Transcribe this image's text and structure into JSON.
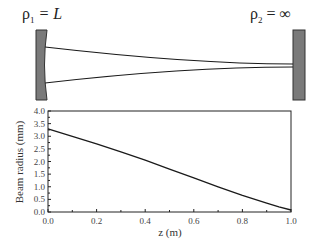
{
  "diagram": {
    "left_mirror": {
      "label_symbol": "ρ",
      "label_sub": "1",
      "label_rest": " = L",
      "type": "concave"
    },
    "right_mirror": {
      "label_symbol": "ρ",
      "label_sub": "2",
      "label_rest": " = ∞",
      "type": "flat"
    },
    "colors": {
      "mirror_fill": "#7a7a7a",
      "mirror_stroke": "#333333",
      "beam": "#1a1a1a"
    }
  },
  "chart_data": {
    "type": "line",
    "title": "",
    "xlabel": "z (m)",
    "ylabel": "Beam radius (mm)",
    "xlim": [
      0.0,
      1.0
    ],
    "ylim": [
      0.0,
      4.0
    ],
    "xticks": [
      "0.0",
      "0.2",
      "0.4",
      "0.6",
      "0.8",
      "1.0"
    ],
    "yticks": [
      "0.0",
      "0.5",
      "1.0",
      "1.5",
      "2.0",
      "2.5",
      "3.0",
      "3.5",
      "4.0"
    ],
    "grid": false,
    "series": [
      {
        "name": "Beam radius",
        "x": [
          0.0,
          0.1,
          0.2,
          0.3,
          0.4,
          0.5,
          0.6,
          0.7,
          0.8,
          0.9,
          0.95,
          1.0
        ],
        "values": [
          3.29,
          3.0,
          2.7,
          2.38,
          2.05,
          1.7,
          1.35,
          1.0,
          0.66,
          0.35,
          0.2,
          0.08
        ]
      }
    ]
  }
}
